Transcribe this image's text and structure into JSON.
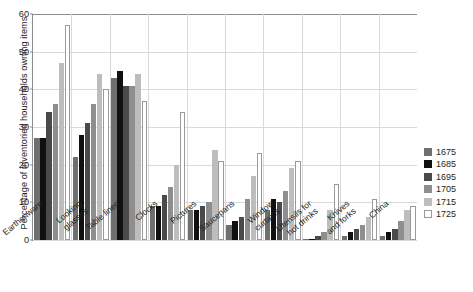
{
  "chart_data": {
    "type": "bar",
    "title": "",
    "xlabel": "",
    "ylabel": "Percentage of inventoried households owning items",
    "ylim": [
      0,
      60
    ],
    "yticks": [
      0,
      10,
      20,
      30,
      40,
      50,
      60
    ],
    "grid": true,
    "legend_position": "right",
    "categories": [
      "Earthenware",
      "Looking\nglasses",
      "Table linen",
      "Clocks",
      "Pictures",
      "Saucepans",
      "Window\ncurtains",
      "Utensils for\nhot drinks",
      "Knives\nand forks",
      "China"
    ],
    "series": [
      {
        "name": "1675",
        "color": "#6f6f6f",
        "values": [
          27,
          22,
          43,
          9,
          8,
          4,
          8,
          0.3,
          1,
          1
        ]
      },
      {
        "name": "1685",
        "color": "#101010",
        "values": [
          27,
          28,
          45,
          9,
          8,
          5,
          11,
          0.4,
          2,
          2
        ]
      },
      {
        "name": "1695",
        "color": "#4a4a4a",
        "values": [
          34,
          31,
          41,
          12,
          9,
          6,
          10,
          1,
          3,
          3
        ]
      },
      {
        "name": "1705",
        "color": "#8e8e8e",
        "values": [
          36,
          36,
          41,
          14,
          10,
          11,
          13,
          2,
          4,
          5
        ]
      },
      {
        "name": "1715",
        "color": "#bdbdbd",
        "values": [
          47,
          44,
          44,
          20,
          24,
          17,
          19,
          8,
          6,
          8
        ]
      },
      {
        "name": "1725",
        "color": "#ffffff",
        "values": [
          57,
          40,
          37,
          34,
          21,
          23,
          21,
          15,
          11,
          9
        ]
      }
    ]
  },
  "legend": {
    "items": [
      {
        "label": "1675"
      },
      {
        "label": "1685"
      },
      {
        "label": "1695"
      },
      {
        "label": "1705"
      },
      {
        "label": "1715"
      },
      {
        "label": "1725"
      }
    ]
  }
}
